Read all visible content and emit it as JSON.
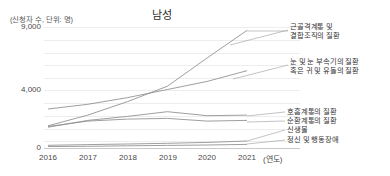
{
  "chart_data": {
    "type": "line",
    "title": "남성",
    "xlabel": "(연도)",
    "ylabel": "(신청자 수, 단위: 명)",
    "categories": [
      "2016",
      "2017",
      "2018",
      "2019",
      "2020",
      "2021"
    ],
    "x": [
      2016,
      2017,
      2018,
      2019,
      2020,
      2021
    ],
    "ylim": [
      0,
      9000
    ],
    "yticks": [
      0,
      4000,
      9000
    ],
    "ytick_labels": [
      "0",
      "4,000",
      "9,000"
    ],
    "grid": true,
    "grid_step": 1000,
    "legend_position": "right-inline-labels",
    "series": [
      {
        "name": "근골격계통 및 결합조직의 질환",
        "label_lines": [
          "근골격계통 및",
          "결합조직의 질환"
        ],
        "color": "#8d8d8d",
        "values": [
          1650,
          2450,
          3450,
          4600,
          6700,
          8750
        ]
      },
      {
        "name": "눈 및 눈 부속기의 질환 혹은 귀 및 유돌의 질환",
        "label_lines": [
          "눈 및 눈 부속기의 질환",
          "혹은 귀 및 유돌의 질환"
        ],
        "color": "#8d8d8d",
        "values": [
          2900,
          3250,
          3750,
          4350,
          4950,
          5750
        ]
      },
      {
        "name": "호흡계통의 질환",
        "label_lines": [
          "호흡계통의 질환"
        ],
        "color": "#8d8d8d",
        "values": [
          1550,
          2050,
          2350,
          2700,
          2400,
          2450
        ]
      },
      {
        "name": "순환계통의 질환",
        "label_lines": [
          "순환계통의 질환"
        ],
        "color": "#8d8d8d",
        "values": [
          1600,
          2000,
          2150,
          2200,
          2000,
          2050
        ]
      },
      {
        "name": "신생물",
        "label_lines": [
          "신생물"
        ],
        "color": "#8d8d8d",
        "values": [
          200,
          250,
          300,
          350,
          420,
          520
        ]
      },
      {
        "name": "정신 및 행동장애",
        "label_lines": [
          "정신 및 행동장애"
        ],
        "color": "#8d8d8d",
        "values": [
          110,
          130,
          160,
          190,
          220,
          270
        ]
      }
    ]
  },
  "labels": {
    "series_0": "근골격계통 및",
    "series_0b": "결합조직의 질환",
    "series_1": "눈 및 눈 부속기의 질환",
    "series_1b": "혹은 귀 및 유돌의 질환",
    "series_2": "호흡계통의 질환",
    "series_3": "순환계통의 질환",
    "series_4": "신생물",
    "series_5": "정신 및 행동장애"
  },
  "axis": {
    "unit_note": "(신청자 수, 단위: 명)",
    "x_unit": "(연도)",
    "y_top": "9,000",
    "y_mid": "4,000",
    "y_zero": "0",
    "x0": "2016",
    "x1": "2017",
    "x2": "2018",
    "x3": "2019",
    "x4": "2020",
    "x5": "2021"
  },
  "colors": {
    "line": "#8d8d8d",
    "grid": "#ededed",
    "text": "#3a3a3a"
  }
}
